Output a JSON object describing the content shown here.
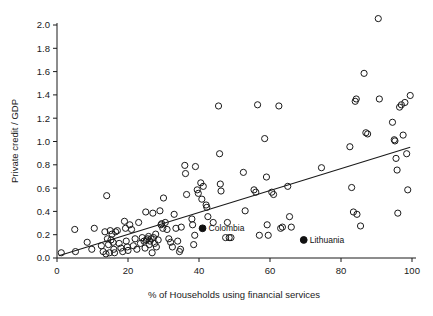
{
  "chart_data": {
    "type": "scatter",
    "title": "",
    "xlabel": "% of Households using financial services",
    "ylabel": "Private credit / GDP",
    "xlim": [
      0,
      100
    ],
    "ylim": [
      0.0,
      2.0
    ],
    "xticks": [
      0,
      20,
      40,
      60,
      80,
      100
    ],
    "yticks": [
      "0.0",
      "0.2",
      "0.4",
      "0.6",
      "0.8",
      "1.0",
      "1.2",
      "1.4",
      "1.6",
      "1.8",
      "2.0"
    ],
    "grid": false,
    "legend": "none",
    "marker_style": "open-circle",
    "marker_color": "#1a1a1a",
    "highlight_marker_style": "filled-circle",
    "trendline": {
      "type": "linear-fit",
      "color": "#1a1a1a",
      "x_start": 0.5,
      "y_start": 0.02,
      "x_end": 99.5,
      "y_end": 0.95
    },
    "annotations": [
      {
        "label": "Colombia",
        "x": 41,
        "y": 0.255
      },
      {
        "label": "Lithuania",
        "x": 69.5,
        "y": 0.155
      }
    ],
    "highlighted_points": [
      {
        "name": "Colombia",
        "x": 41,
        "y": 0.255
      },
      {
        "name": "Lithuania",
        "x": 69.5,
        "y": 0.155
      }
    ],
    "points": [
      [
        1.2,
        0.045
      ],
      [
        5.0,
        0.245
      ],
      [
        5.2,
        0.055
      ],
      [
        8.5,
        0.135
      ],
      [
        9.8,
        0.075
      ],
      [
        10.5,
        0.255
      ],
      [
        12.5,
        0.105
      ],
      [
        13.0,
        0.055
      ],
      [
        13.5,
        0.225
      ],
      [
        13.8,
        0.035
      ],
      [
        14.0,
        0.535
      ],
      [
        14.2,
        0.165
      ],
      [
        14.5,
        0.115
      ],
      [
        14.8,
        0.045
      ],
      [
        15.0,
        0.235
      ],
      [
        15.2,
        0.155
      ],
      [
        15.5,
        0.205
      ],
      [
        15.8,
        0.135
      ],
      [
        16.0,
        0.075
      ],
      [
        16.2,
        0.045
      ],
      [
        16.5,
        0.225
      ],
      [
        17.0,
        0.235
      ],
      [
        17.5,
        0.125
      ],
      [
        18.0,
        0.085
      ],
      [
        18.5,
        0.055
      ],
      [
        19.0,
        0.315
      ],
      [
        19.3,
        0.255
      ],
      [
        19.5,
        0.145
      ],
      [
        19.8,
        0.095
      ],
      [
        20.0,
        0.065
      ],
      [
        20.5,
        0.285
      ],
      [
        21.0,
        0.245
      ],
      [
        21.5,
        0.105
      ],
      [
        22.0,
        0.165
      ],
      [
        22.5,
        0.075
      ],
      [
        23.0,
        0.305
      ],
      [
        23.5,
        0.125
      ],
      [
        24.0,
        0.175
      ],
      [
        24.5,
        0.145
      ],
      [
        24.8,
        0.085
      ],
      [
        25.0,
        0.395
      ],
      [
        25.2,
        0.155
      ],
      [
        25.5,
        0.165
      ],
      [
        25.8,
        0.185
      ],
      [
        26.0,
        0.115
      ],
      [
        26.2,
        0.145
      ],
      [
        26.5,
        0.165
      ],
      [
        26.8,
        0.045
      ],
      [
        27.0,
        0.385
      ],
      [
        27.2,
        0.175
      ],
      [
        27.5,
        0.125
      ],
      [
        27.8,
        0.205
      ],
      [
        28.0,
        0.095
      ],
      [
        28.5,
        0.155
      ],
      [
        29.0,
        0.405
      ],
      [
        29.3,
        0.285
      ],
      [
        29.5,
        0.295
      ],
      [
        29.8,
        0.255
      ],
      [
        30.0,
        0.515
      ],
      [
        30.5,
        0.305
      ],
      [
        31.0,
        0.245
      ],
      [
        31.5,
        0.165
      ],
      [
        32.0,
        0.135
      ],
      [
        32.5,
        0.095
      ],
      [
        33.0,
        0.375
      ],
      [
        33.5,
        0.255
      ],
      [
        34.0,
        0.145
      ],
      [
        34.5,
        0.055
      ],
      [
        34.8,
        0.075
      ],
      [
        35.0,
        0.265
      ],
      [
        36.0,
        0.795
      ],
      [
        36.2,
        0.725
      ],
      [
        36.5,
        0.545
      ],
      [
        38.0,
        0.335
      ],
      [
        38.2,
        0.285
      ],
      [
        38.5,
        0.115
      ],
      [
        38.8,
        0.195
      ],
      [
        39.0,
        0.785
      ],
      [
        39.5,
        0.585
      ],
      [
        39.8,
        0.555
      ],
      [
        40.5,
        0.645
      ],
      [
        40.8,
        0.505
      ],
      [
        41.2,
        0.615
      ],
      [
        42.0,
        0.455
      ],
      [
        42.2,
        0.435
      ],
      [
        42.5,
        0.355
      ],
      [
        44.0,
        0.305
      ],
      [
        45.5,
        1.305
      ],
      [
        45.8,
        0.895
      ],
      [
        46.0,
        0.635
      ],
      [
        46.2,
        0.575
      ],
      [
        47.5,
        0.175
      ],
      [
        48.0,
        0.305
      ],
      [
        48.5,
        0.175
      ],
      [
        49.0,
        0.175
      ],
      [
        52.5,
        0.735
      ],
      [
        53.0,
        0.405
      ],
      [
        55.5,
        0.585
      ],
      [
        56.0,
        0.565
      ],
      [
        56.5,
        1.315
      ],
      [
        57.0,
        0.195
      ],
      [
        58.5,
        1.025
      ],
      [
        59.0,
        0.695
      ],
      [
        59.2,
        0.285
      ],
      [
        59.5,
        0.195
      ],
      [
        60.5,
        0.565
      ],
      [
        61.0,
        0.545
      ],
      [
        62.5,
        1.305
      ],
      [
        63.0,
        0.255
      ],
      [
        63.5,
        0.265
      ],
      [
        65.0,
        0.615
      ],
      [
        65.5,
        0.355
      ],
      [
        66.0,
        0.265
      ],
      [
        74.5,
        0.775
      ],
      [
        82.5,
        0.955
      ],
      [
        83.0,
        0.605
      ],
      [
        83.5,
        0.395
      ],
      [
        84.0,
        1.345
      ],
      [
        84.3,
        1.365
      ],
      [
        84.5,
        0.375
      ],
      [
        85.5,
        0.275
      ],
      [
        86.5,
        1.585
      ],
      [
        87.0,
        1.075
      ],
      [
        87.5,
        1.065
      ],
      [
        90.5,
        2.055
      ],
      [
        90.8,
        1.365
      ],
      [
        94.5,
        1.165
      ],
      [
        95.0,
        1.015
      ],
      [
        95.2,
        1.005
      ],
      [
        95.5,
        0.855
      ],
      [
        95.8,
        0.755
      ],
      [
        96.0,
        0.385
      ],
      [
        96.5,
        1.295
      ],
      [
        97.0,
        1.315
      ],
      [
        97.5,
        1.055
      ],
      [
        98.0,
        1.335
      ],
      [
        98.5,
        0.895
      ],
      [
        98.8,
        0.585
      ],
      [
        99.5,
        1.395
      ]
    ]
  }
}
